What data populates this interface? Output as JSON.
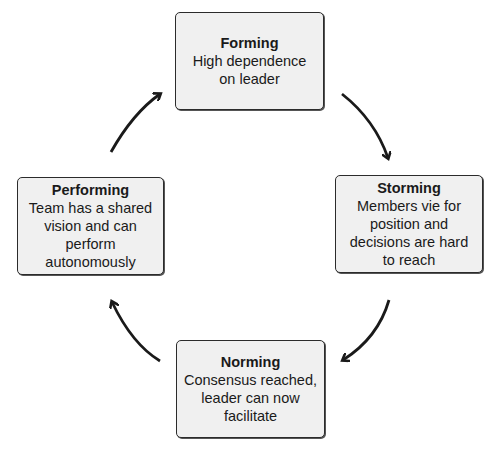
{
  "diagram": {
    "type": "cycle",
    "stages": [
      {
        "id": "forming",
        "title": "Forming",
        "description": "High dependence on leader"
      },
      {
        "id": "storming",
        "title": "Storming",
        "description": "Members vie for position and decisions are hard to reach"
      },
      {
        "id": "norming",
        "title": "Norming",
        "description": "Consensus reached, leader can now facilitate"
      },
      {
        "id": "performing",
        "title": "Performing",
        "description": "Team has a shared vision and can perform autonomously"
      }
    ],
    "arrows": [
      {
        "from": "forming",
        "to": "storming",
        "direction": "clockwise"
      },
      {
        "from": "storming",
        "to": "norming",
        "direction": "clockwise"
      },
      {
        "from": "norming",
        "to": "performing",
        "direction": "clockwise"
      },
      {
        "from": "performing",
        "to": "forming",
        "direction": "clockwise"
      }
    ],
    "colors": {
      "box_fill": "#f0f0f0",
      "box_border": "#2b2b2b",
      "arrow": "#1a1a1a",
      "background": "#ffffff"
    }
  }
}
